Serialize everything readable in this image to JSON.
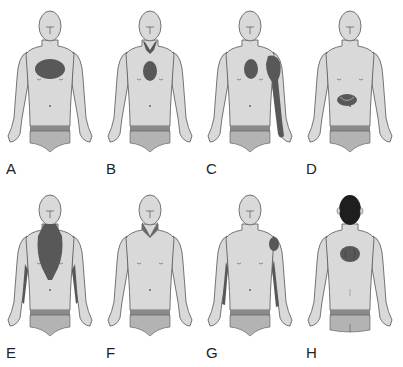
{
  "colors": {
    "skin": "#d9d9d9",
    "outline": "#555555",
    "pain": "#585858",
    "briefs": "#b3b3b3",
    "waistband": "#8a8a8a",
    "hair": "#1e1e1e"
  },
  "panels": [
    {
      "label": "A",
      "view": "front",
      "pain_region": "central chest (large oval)"
    },
    {
      "label": "B",
      "view": "front",
      "pain_region": "mid-sternal oval with throat/neck"
    },
    {
      "label": "C",
      "view": "front",
      "pain_region": "left chest oval, left shoulder and inner left arm"
    },
    {
      "label": "D",
      "view": "front",
      "pain_region": "epigastric"
    },
    {
      "label": "E",
      "view": "front",
      "pain_region": "neck, central chest and both inner arms"
    },
    {
      "label": "F",
      "view": "front",
      "pain_region": "throat/lower jaw"
    },
    {
      "label": "G",
      "view": "front",
      "pain_region": "left shoulder and both inner arms"
    },
    {
      "label": "H",
      "view": "back",
      "pain_region": "interscapular back"
    }
  ]
}
